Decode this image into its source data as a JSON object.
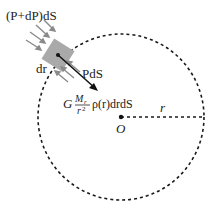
{
  "diagram": {
    "labels": {
      "top_pressure": "(P+dP)dS",
      "bottom_pressure": "PdS",
      "thickness": "dr",
      "gravity_prefix": "G",
      "gravity_num": "M",
      "gravity_num_sub": "r",
      "gravity_den": "r",
      "gravity_den_sup": "2",
      "gravity_rest": "ρ(r)drdS",
      "center": "O",
      "radius": "r"
    },
    "colors": {
      "element_fill": "#a9a9a9",
      "arrow_gray": "#8a8a8a",
      "line": "#1a1a1a"
    }
  }
}
